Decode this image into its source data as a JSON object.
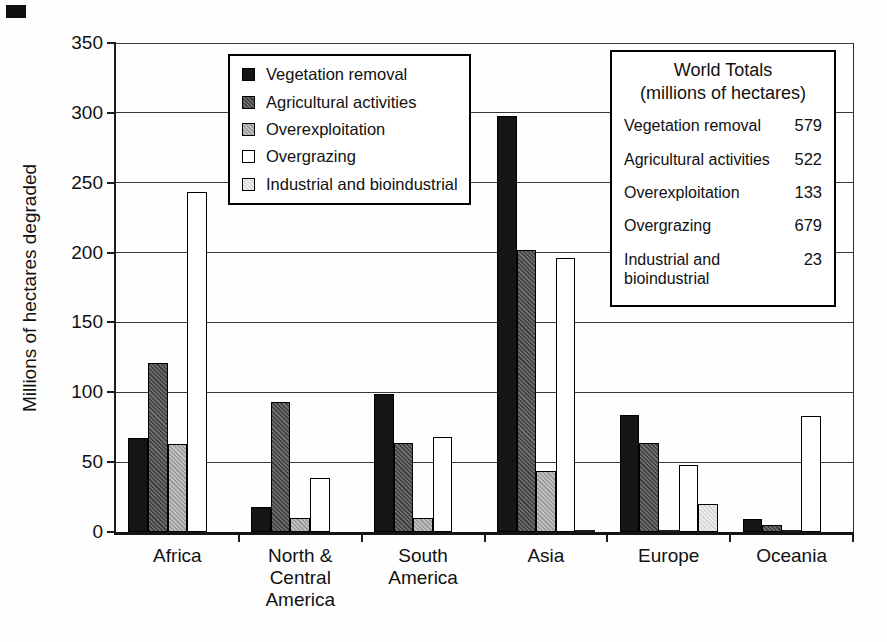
{
  "chart_data": {
    "type": "bar",
    "title": "",
    "xlabel": "",
    "ylabel": "Millions of hectares degraded",
    "ylim": [
      0,
      350
    ],
    "yticks": [
      0,
      50,
      100,
      150,
      200,
      250,
      300,
      350
    ],
    "grid": true,
    "legend_position": "inside-top-left",
    "categories": [
      "Africa",
      "North &\nCentral\nAmerica",
      "South\nAmerica",
      "Asia",
      "Europe",
      "Oceania"
    ],
    "series": [
      {
        "name": "Vegetation removal",
        "color": "#151515",
        "pattern": "solid-black",
        "values": [
          67,
          18,
          99,
          298,
          84,
          9
        ]
      },
      {
        "name": "Agricultural activities",
        "color": "#5f5f5f",
        "pattern": "dark-halftone",
        "values": [
          121,
          93,
          64,
          202,
          64,
          5
        ]
      },
      {
        "name": "Overexploitation",
        "color": "#b2b2b2",
        "pattern": "medium-halftone",
        "values": [
          63,
          10,
          10,
          44,
          1,
          1
        ]
      },
      {
        "name": "Overgrazing",
        "color": "#ffffff",
        "pattern": "white-outline",
        "values": [
          243,
          39,
          68,
          196,
          48,
          83
        ]
      },
      {
        "name": "Industrial and bioindustrial",
        "color": "#e2e2e2",
        "pattern": "light-halftone",
        "values": [
          0,
          0,
          0,
          1,
          20,
          0
        ]
      }
    ]
  },
  "totals_box": {
    "title_line1": "World Totals",
    "title_line2": "(millions of hectares)",
    "rows": [
      {
        "label": "Vegetation removal",
        "value": "579"
      },
      {
        "label": "Agricultural activities",
        "value": "522"
      },
      {
        "label": "Overexploitation",
        "value": "133"
      },
      {
        "label": "Overgrazing",
        "value": "679"
      },
      {
        "label": "Industrial and\nbioindustrial",
        "value": "23"
      }
    ]
  }
}
